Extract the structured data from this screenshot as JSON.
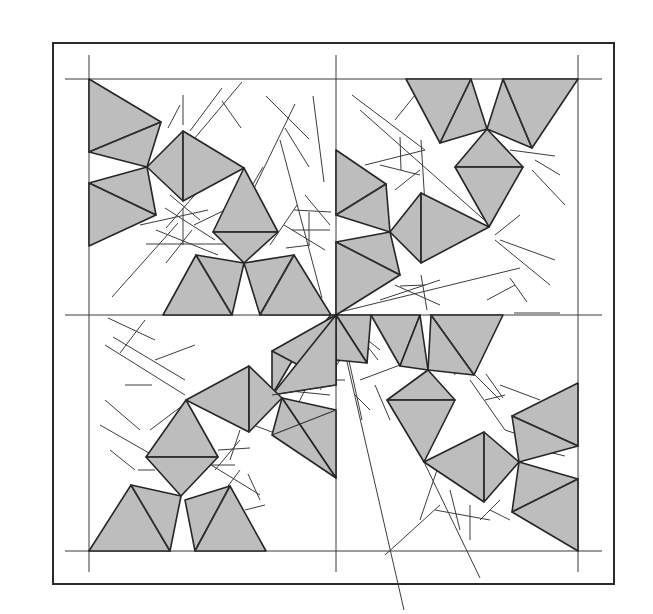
{
  "figure": {
    "type": "geometric tiling diagram",
    "colors": {
      "tile_fill": "#bdbdbd",
      "tile_stroke": "#262626",
      "line": "#3c3c3c",
      "background": "#ffffff"
    },
    "frame": {
      "x": 53,
      "y": 43,
      "width": 561,
      "height": 541
    },
    "grid": {
      "horizontal_y": [
        79,
        315,
        551
      ],
      "vertical_x": [
        89,
        336,
        578
      ]
    }
  },
  "tiles": [
    {
      "points": "89,79 161,122 89,152"
    },
    {
      "points": "161,122 147,167 89,152"
    },
    {
      "points": "89,183 147,167 156,215"
    },
    {
      "points": "89,183 156,215 89,246"
    },
    {
      "points": "147,167 183,131 183,201"
    },
    {
      "points": "183,131 244,168 183,201"
    },
    {
      "points": "244,168 213,232 278,232"
    },
    {
      "points": "213,232 278,232 244,263"
    },
    {
      "points": "196,255 163,315 232,315"
    },
    {
      "points": "196,255 244,263 232,315"
    },
    {
      "points": "244,263 294,255 260,315"
    },
    {
      "points": "294,255 331,315 260,315"
    },
    {
      "points": "336,150 386,184 336,215"
    },
    {
      "points": "386,184 390,232 336,215"
    },
    {
      "points": "390,232 421,193 421,263"
    },
    {
      "points": "421,193 489,227 421,263"
    },
    {
      "points": "336,242 390,232 400,275"
    },
    {
      "points": "336,242 400,275 336,315"
    },
    {
      "points": "406,79 471,79 440,143"
    },
    {
      "points": "471,79 487,129 440,143"
    },
    {
      "points": "487,129 503,79 532,148"
    },
    {
      "points": "503,79 578,79 532,148"
    },
    {
      "points": "487,129 455,167 523,167"
    },
    {
      "points": "455,167 523,167 489,227"
    },
    {
      "points": "336,315 371,315 367,363"
    },
    {
      "points": "371,315 420,315 400,366"
    },
    {
      "points": "336,315 367,363 295,356"
    },
    {
      "points": "337,315 295,356 331,315"
    },
    {
      "points": "420,315 428,370 400,366"
    },
    {
      "points": "431,315 503,315 474,375"
    },
    {
      "points": "431,315 474,375 428,370"
    },
    {
      "points": "428,370 387,400 455,400"
    },
    {
      "points": "387,400 455,400 424,462"
    },
    {
      "points": "424,462 484,432 484,502"
    },
    {
      "points": "484,432 519,462 484,502"
    },
    {
      "points": "512,416 578,383 578,446"
    },
    {
      "points": "512,416 578,446 519,462"
    },
    {
      "points": "519,462 578,479 512,512"
    },
    {
      "points": "578,479 578,551 512,512"
    },
    {
      "points": "295,356 272,351 272,395"
    },
    {
      "points": "272,351 336,315 336,385"
    },
    {
      "points": "272,395 336,385 336,315"
    },
    {
      "points": "186,400 249,366 249,432"
    },
    {
      "points": "249,366 282,398 249,432"
    },
    {
      "points": "282,398 336,410 336,478"
    },
    {
      "points": "282,398 272,435 336,478"
    },
    {
      "points": "186,400 146,457 218,457"
    },
    {
      "points": "146,457 218,457 181,496"
    },
    {
      "points": "131,485 89,551 170,551"
    },
    {
      "points": "131,485 181,496 170,551"
    },
    {
      "points": "185,500 230,486 195,551"
    },
    {
      "points": "230,486 266,551 195,551"
    }
  ],
  "inner_edges": [
    "89,152 161,122",
    "89,183 156,215",
    "183,131 183,201",
    "213,232 278,232",
    "196,255 232,315",
    "294,255 260,315",
    "336,215 386,184",
    "421,193 421,263",
    "336,242 400,275",
    "471,79 440,143",
    "503,79 532,148",
    "455,167 523,167",
    "371,315 400,366",
    "431,315 474,375",
    "387,400 455,400",
    "484,432 484,502",
    "512,416 578,446",
    "512,512 578,479",
    "249,366 249,432",
    "272,435 336,410",
    "146,457 218,457",
    "131,485 170,551",
    "230,486 195,551",
    "272,395 336,385"
  ],
  "rays": [
    "168,128 180,105",
    "183,95 183,125",
    "190,131 222,88",
    "194,139 242,82",
    "222,101 241,128",
    "240,206 263,167",
    "247,203 295,104",
    "266,96 309,139",
    "313,96 324,182",
    "285,128 309,167",
    "280,140 322,298",
    "156,230 218,255",
    "166,228 199,190",
    "140,225 208,210",
    "165,208 215,240",
    "183,208 183,245",
    "192,230 166,263",
    "112,297 178,223",
    "146,244 225,244",
    "194,225 225,210",
    "170,195 200,220",
    "292,230 330,230",
    "294,210 331,212",
    "309,212 309,245",
    "284,225 325,250",
    "305,195 330,225",
    "270,245 297,205",
    "286,248 310,245",
    "352,95 425,150",
    "415,95 395,120",
    "360,110 490,225",
    "365,165 425,150",
    "400,137 401,170",
    "380,165 420,175",
    "421,140 425,205",
    "395,190 420,170",
    "510,150 555,156",
    "535,160 560,175",
    "532,170 565,205",
    "495,235 520,215",
    "500,240 555,260",
    "495,240 550,285",
    "340,312 520,268",
    "510,278 527,302",
    "514,313 560,313",
    "487,300 515,285",
    "421,275 427,310",
    "395,285 440,305",
    "400,286 425,285",
    "380,300 440,280",
    "336,315 380,350",
    "340,320 362,420",
    "355,330 378,360",
    "342,340 404,610",
    "300,370 355,357",
    "310,380 345,380",
    "320,390 360,330",
    "360,380 400,365",
    "355,395 370,410",
    "375,385 390,420",
    "395,400 430,420",
    "446,335 455,375",
    "470,370 500,400",
    "485,400 505,395",
    "470,380 505,430",
    "486,374 503,398",
    "500,385 540,400",
    "505,430 535,440",
    "540,450 565,456",
    "437,470 420,520",
    "424,462 480,578",
    "450,490 460,530",
    "470,505 470,540",
    "480,520 500,500",
    "490,510 510,520",
    "440,505 385,555",
    "435,510 490,520",
    "108,318 155,340",
    "113,337 185,380",
    "145,320 120,353",
    "125,385 152,385",
    "155,360 195,345",
    "150,430 190,400",
    "105,400 140,430",
    "110,450 135,470",
    "100,425 170,465",
    "138,470 155,470",
    "195,465 235,465",
    "215,470 240,440",
    "225,490 240,470",
    "218,450 250,448",
    "240,430 230,460",
    "195,455 260,495",
    "245,510 265,505",
    "248,474 260,500",
    "105,345 185,395",
    "218,412 280,435",
    "290,420 310,380",
    "280,390 330,395"
  ]
}
